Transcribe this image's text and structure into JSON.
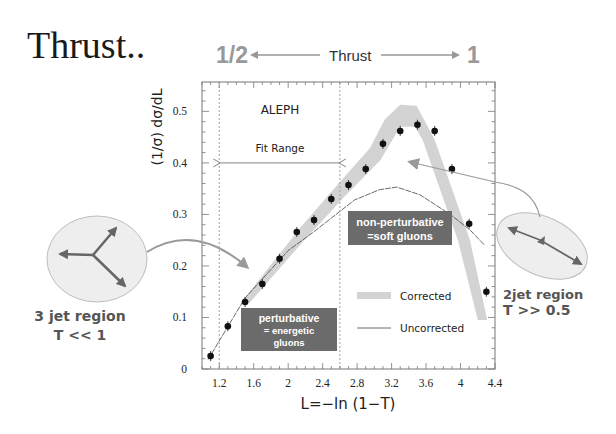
{
  "slide": {
    "title": "Thrust..",
    "thrust_scale": {
      "left_value": "1/2",
      "label": "Thrust",
      "right_value": "1"
    },
    "left_annotation": {
      "line1": "3 jet region",
      "line2": "T << 1"
    },
    "right_annotation": {
      "line1": "2jet region",
      "line2": "T >> 0.5"
    },
    "colors": {
      "scale_gray": "#999999",
      "box_fill": "#6b6b6b",
      "band_fill": "#d3d3d3",
      "ellipse_fill": "#eeeeee",
      "arrow_gray": "#999999",
      "region_text": "#555555"
    }
  },
  "chart_data": {
    "type": "scatter",
    "title": "",
    "experiment_label": "ALEPH",
    "xlabel": "L=−ln (1−T)",
    "ylabel": "(1/σ) dσ/dL",
    "xlim": [
      1.0,
      4.4
    ],
    "ylim": [
      0,
      0.557
    ],
    "x_ticks": [
      1.2,
      1.6,
      2,
      2.4,
      2.8,
      3.2,
      3.6,
      4,
      4.4
    ],
    "x_tick_labels": [
      "1.2",
      "1.6",
      "2",
      "2.4",
      "2.8",
      "3.2",
      "3.6",
      "4",
      "4.4"
    ],
    "y_ticks": [
      0,
      0.1,
      0.2,
      0.3,
      0.4,
      0.5
    ],
    "y_tick_labels": [
      "0",
      "0.1",
      "0.2",
      "0.3",
      "0.4",
      "0.5"
    ],
    "grid": false,
    "fit_range": {
      "label": "Fit Range",
      "x_min": 1.2,
      "x_max": 2.6,
      "y": 0.4
    },
    "series": [
      {
        "name": "Data",
        "type": "scatter",
        "x": [
          1.1,
          1.3,
          1.5,
          1.7,
          1.9,
          2.1,
          2.3,
          2.5,
          2.7,
          2.9,
          3.1,
          3.3,
          3.5,
          3.7,
          3.9,
          4.1,
          4.3
        ],
        "y": [
          0.025,
          0.083,
          0.13,
          0.165,
          0.214,
          0.266,
          0.289,
          0.33,
          0.357,
          0.388,
          0.437,
          0.462,
          0.474,
          0.462,
          0.388,
          0.282,
          0.15
        ]
      },
      {
        "name": "Corrected",
        "type": "band",
        "upper": [
          [
            1.45,
            0.128
          ],
          [
            2.14,
            0.274
          ],
          [
            2.62,
            0.367
          ],
          [
            2.95,
            0.429
          ],
          [
            3.12,
            0.484
          ],
          [
            3.3,
            0.513
          ],
          [
            3.49,
            0.511
          ],
          [
            3.7,
            0.445
          ],
          [
            4.11,
            0.25
          ],
          [
            4.31,
            0.095
          ]
        ],
        "lower": [
          [
            4.2,
            0.095
          ],
          [
            3.97,
            0.25
          ],
          [
            3.56,
            0.445
          ],
          [
            3.47,
            0.47
          ],
          [
            3.3,
            0.47
          ],
          [
            3.07,
            0.405
          ],
          [
            2.66,
            0.336
          ],
          [
            2.14,
            0.241
          ],
          [
            1.55,
            0.128
          ]
        ]
      },
      {
        "name": "Uncorrected",
        "type": "line",
        "points": [
          [
            1.07,
            0.018
          ],
          [
            1.5,
            0.138
          ],
          [
            2.0,
            0.23
          ],
          [
            2.28,
            0.264
          ],
          [
            2.77,
            0.328
          ],
          [
            3.06,
            0.348
          ],
          [
            3.26,
            0.353
          ],
          [
            3.53,
            0.338
          ],
          [
            3.88,
            0.3
          ],
          [
            4.11,
            0.27
          ],
          [
            4.28,
            0.24
          ]
        ]
      }
    ],
    "legend": {
      "position": "lower right inside",
      "entries": [
        {
          "label": "Corrected",
          "style": "band"
        },
        {
          "label": "Uncorrected",
          "style": "line"
        }
      ]
    },
    "annotations": [
      {
        "id": "non_perturbative",
        "lines": [
          "non-perturbative",
          "=soft gluons"
        ]
      },
      {
        "id": "perturbative",
        "lines": [
          "perturbative",
          "= energetic",
          "gluons"
        ]
      }
    ]
  }
}
